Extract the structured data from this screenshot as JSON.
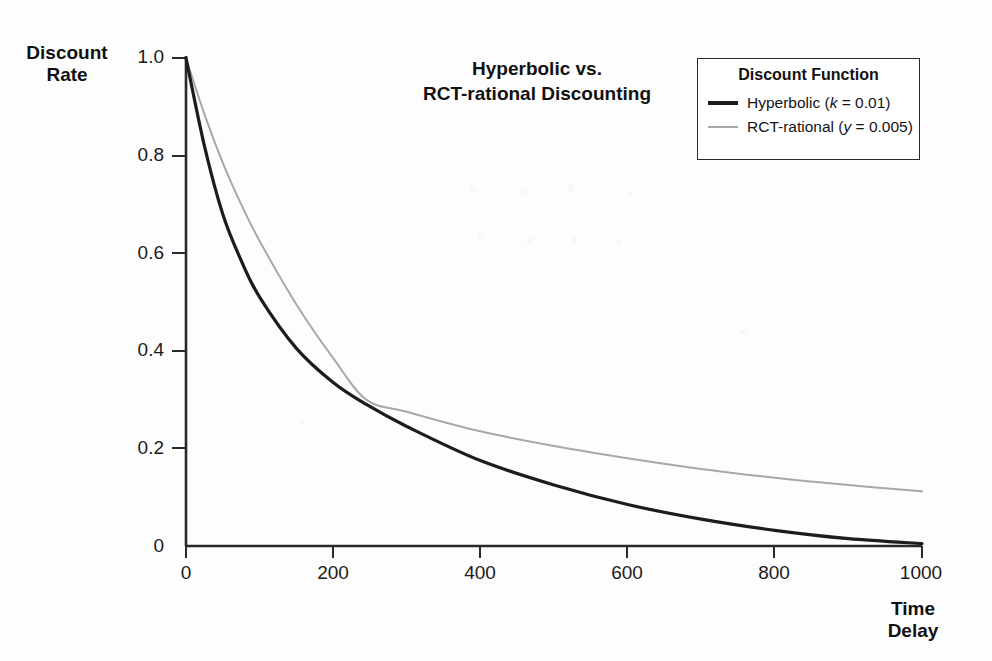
{
  "chart_data": {
    "type": "line",
    "title": "Hyperbolic vs.\nRCT-rational Discounting",
    "xlabel": "Time\nDelay",
    "ylabel": "Discount\nRate",
    "xlim": [
      0,
      1000
    ],
    "ylim": [
      0,
      1.0
    ],
    "xticks": [
      "0",
      "200",
      "400",
      "600",
      "800",
      "1000"
    ],
    "xtick_values": [
      0,
      200,
      400,
      600,
      800,
      1000
    ],
    "yticks": [
      "0",
      "0.2",
      "0.4",
      "0.6",
      "0.8",
      "1.0"
    ],
    "ytick_values": [
      0,
      0.2,
      0.4,
      0.6,
      0.8,
      1.0
    ],
    "grid": false,
    "legend_position": "top-right",
    "legend_title": "Discount Function",
    "series": [
      {
        "name": "Hyperbolic (k = 0.01)",
        "label_plain": "Hyperbolic (",
        "label_italic": "k",
        "label_tail": " = 0.01)",
        "color": "#1c1c1c",
        "width": 3.2,
        "formula": "1 / (1 + 0.01 * t)",
        "x": [
          0,
          25,
          50,
          75,
          100,
          150,
          200,
          245,
          300,
          400,
          500,
          600,
          700,
          800,
          900,
          1000
        ],
        "values": [
          1.0,
          0.8,
          0.667,
          0.571,
          0.5,
          0.4,
          0.333,
          0.29,
          0.25,
          0.2,
          0.167,
          0.143,
          0.125,
          0.111,
          0.1,
          0.091
        ]
      },
      {
        "name": "RCT-rational (y = 0.005)",
        "label_plain": "RCT-rational (",
        "label_italic": "y",
        "label_tail": " = 0.005)",
        "color": "#a8a8a8",
        "width": 2.0,
        "formula": "exp(-0.005 * t)",
        "x": [
          0,
          25,
          50,
          75,
          100,
          150,
          200,
          245,
          300,
          400,
          500,
          600,
          700,
          800,
          900,
          1000
        ],
        "values": [
          1.0,
          0.882,
          0.779,
          0.687,
          0.607,
          0.472,
          0.368,
          0.294,
          0.223,
          0.135,
          0.082,
          0.05,
          0.03,
          0.018,
          0.011,
          0.0067
        ]
      }
    ],
    "drawn_curves": {
      "hyperbolic_drawn": {
        "x": [
          0,
          25,
          50,
          75,
          100,
          150,
          200,
          245,
          300,
          400,
          500,
          600,
          700,
          800,
          900,
          1000
        ],
        "y": [
          1.0,
          0.82,
          0.68,
          0.585,
          0.51,
          0.405,
          0.335,
          0.29,
          0.245,
          0.175,
          0.125,
          0.085,
          0.055,
          0.032,
          0.015,
          0.005
        ]
      },
      "rct_rational_drawn": {
        "x": [
          0,
          25,
          50,
          75,
          100,
          150,
          200,
          245,
          300,
          400,
          500,
          600,
          700,
          800,
          900,
          1000
        ],
        "y": [
          1.0,
          0.885,
          0.785,
          0.7,
          0.625,
          0.495,
          0.385,
          0.3,
          0.275,
          0.235,
          0.205,
          0.18,
          0.158,
          0.14,
          0.125,
          0.112
        ]
      }
    }
  },
  "legend": {
    "title": "Discount Function",
    "items": [
      {
        "label": "Hyperbolic (k = 0.01)",
        "swatch": "black-line-swatch"
      },
      {
        "label": "RCT-rational (y = 0.005)",
        "swatch": "gray-line-swatch"
      }
    ]
  },
  "colors": {
    "hyperbolic": "#1c1c1c",
    "rct_rational": "#a8a8a8",
    "axis": "#2a2a2a",
    "background": "#fdfdfd",
    "text": "#111111"
  }
}
